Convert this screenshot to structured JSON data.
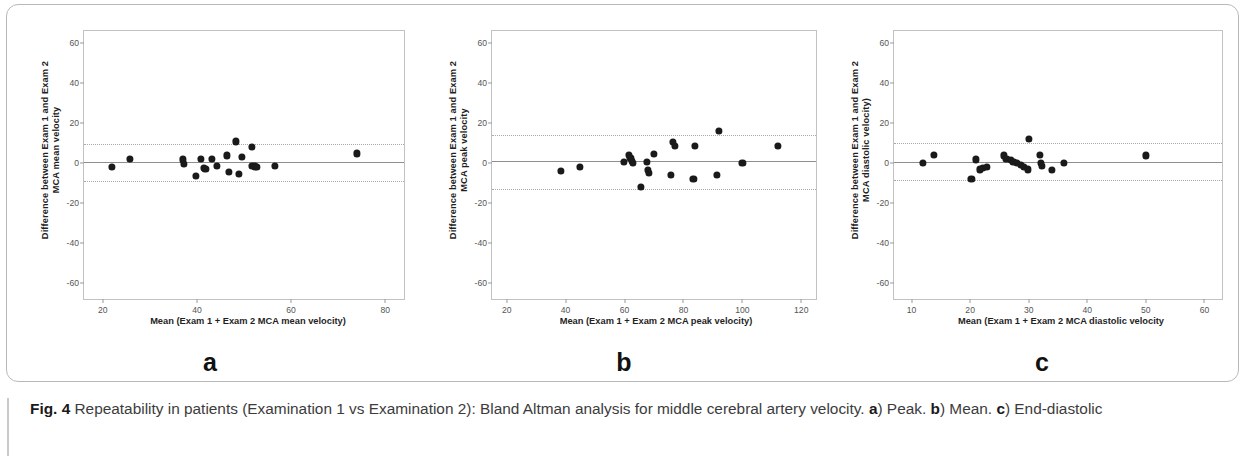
{
  "figure": {
    "caption_label": "Fig. 4",
    "caption_text": " Repeatability in patients (Examination 1 vs Examination 2): Bland Altman analysis for middle cerebral artery velocity. ",
    "caption_a": "a",
    "caption_a_text": ") Peak. ",
    "caption_b": "b",
    "caption_b_text": ") Mean. ",
    "caption_c": "c",
    "caption_c_text": ") End-diastolic"
  },
  "chart_data": [
    {
      "type": "scatter",
      "panel": "a",
      "panel_letter": "a",
      "title": "",
      "xlabel": "Mean (Exam 1 + Exam 2 MCA mean velocity)",
      "ylabel_line1": "Difference between Exam 1 and Exam 2",
      "ylabel_line2": "MCA mean velocity",
      "xlim": [
        16,
        84
      ],
      "ylim": [
        -68,
        66
      ],
      "xticks": [
        20,
        40,
        60,
        80
      ],
      "yticks": [
        60,
        40,
        20,
        0,
        -20,
        -40,
        -60
      ],
      "grid": false,
      "legend": "none",
      "mean_line": 0.5,
      "upper_loa": 9.5,
      "lower_loa": -9.0,
      "points": [
        {
          "x": 22.0,
          "y": -1.8
        },
        {
          "x": 25.8,
          "y": 2.0
        },
        {
          "x": 37.0,
          "y": 1.8
        },
        {
          "x": 37.2,
          "y": -0.6
        },
        {
          "x": 39.8,
          "y": -6.6
        },
        {
          "x": 40.8,
          "y": 2.1
        },
        {
          "x": 41.4,
          "y": -2.6
        },
        {
          "x": 41.8,
          "y": -3.1
        },
        {
          "x": 43.2,
          "y": 2.0
        },
        {
          "x": 44.3,
          "y": -1.4
        },
        {
          "x": 46.4,
          "y": 3.8
        },
        {
          "x": 46.8,
          "y": -4.3
        },
        {
          "x": 48.2,
          "y": 10.8
        },
        {
          "x": 48.9,
          "y": -5.6
        },
        {
          "x": 49.6,
          "y": 3.0
        },
        {
          "x": 51.6,
          "y": 7.9
        },
        {
          "x": 51.8,
          "y": -1.6
        },
        {
          "x": 52.4,
          "y": -1.7
        },
        {
          "x": 52.7,
          "y": -1.8
        },
        {
          "x": 56.6,
          "y": -1.6
        },
        {
          "x": 74.0,
          "y": 4.8
        }
      ]
    },
    {
      "type": "scatter",
      "panel": "b",
      "panel_letter": "b",
      "title": "",
      "xlabel": "Mean (Exam 1 + Exam 2 MCA peak velocity)",
      "ylabel_line1": "Difference between Exam 1 and Exam 2",
      "ylabel_line2": "MCA peak velocity",
      "xlim": [
        15,
        125
      ],
      "ylim": [
        -68,
        66
      ],
      "xticks": [
        20,
        40,
        60,
        80,
        100,
        120
      ],
      "yticks": [
        60,
        40,
        20,
        0,
        -20,
        -40,
        -60
      ],
      "grid": false,
      "legend": "none",
      "mean_line": 0.8,
      "upper_loa": 14.2,
      "lower_loa": -13.2,
      "points": [
        {
          "x": 38.4,
          "y": -4.0
        },
        {
          "x": 44.8,
          "y": -1.8
        },
        {
          "x": 59.8,
          "y": 0.4
        },
        {
          "x": 61.6,
          "y": 4.2
        },
        {
          "x": 62.0,
          "y": 2.6
        },
        {
          "x": 62.4,
          "y": 1.0
        },
        {
          "x": 62.8,
          "y": 0.2
        },
        {
          "x": 65.6,
          "y": -11.8
        },
        {
          "x": 67.6,
          "y": 0.6
        },
        {
          "x": 68.0,
          "y": -3.6
        },
        {
          "x": 68.4,
          "y": -5.0
        },
        {
          "x": 70.0,
          "y": 4.4
        },
        {
          "x": 75.8,
          "y": -6.0
        },
        {
          "x": 76.4,
          "y": 10.4
        },
        {
          "x": 77.0,
          "y": 8.6
        },
        {
          "x": 83.4,
          "y": -8.0
        },
        {
          "x": 84.0,
          "y": 8.4
        },
        {
          "x": 91.4,
          "y": -6.0
        },
        {
          "x": 92.0,
          "y": 16.0
        },
        {
          "x": 100.0,
          "y": 0.2
        },
        {
          "x": 112.0,
          "y": 8.4
        }
      ]
    },
    {
      "type": "scatter",
      "panel": "c",
      "panel_letter": "c",
      "title": "",
      "xlabel": "Mean (Exam 1 + Exam 2 MCA diastolic velocity",
      "ylabel_line1": "Difference between Exam 1 and Exam 2",
      "ylabel_line2": "MCA diastolic velocity)",
      "xlim": [
        7,
        63
      ],
      "ylim": [
        -68,
        66
      ],
      "xticks": [
        10,
        20,
        30,
        40,
        50,
        60
      ],
      "yticks": [
        60,
        40,
        20,
        0,
        -20,
        -40,
        -60
      ],
      "grid": false,
      "legend": "none",
      "mean_line": 0.7,
      "upper_loa": 9.8,
      "lower_loa": -8.6,
      "points": [
        {
          "x": 12.0,
          "y": 0.0
        },
        {
          "x": 13.8,
          "y": 4.0
        },
        {
          "x": 20.2,
          "y": -8.0
        },
        {
          "x": 21.0,
          "y": 1.8
        },
        {
          "x": 21.6,
          "y": -3.2
        },
        {
          "x": 22.2,
          "y": -2.4
        },
        {
          "x": 22.8,
          "y": -1.8
        },
        {
          "x": 25.8,
          "y": 3.8
        },
        {
          "x": 26.2,
          "y": 2.0
        },
        {
          "x": 26.9,
          "y": 1.4
        },
        {
          "x": 27.4,
          "y": 0.6
        },
        {
          "x": 28.0,
          "y": 0.0
        },
        {
          "x": 28.6,
          "y": -0.8
        },
        {
          "x": 29.2,
          "y": -1.8
        },
        {
          "x": 29.8,
          "y": -3.2
        },
        {
          "x": 30.0,
          "y": 12.0
        },
        {
          "x": 31.9,
          "y": 4.0
        },
        {
          "x": 32.1,
          "y": 0.2
        },
        {
          "x": 32.2,
          "y": -1.4
        },
        {
          "x": 34.0,
          "y": -3.6
        },
        {
          "x": 36.0,
          "y": 0.2
        },
        {
          "x": 50.0,
          "y": 3.8
        }
      ]
    }
  ]
}
